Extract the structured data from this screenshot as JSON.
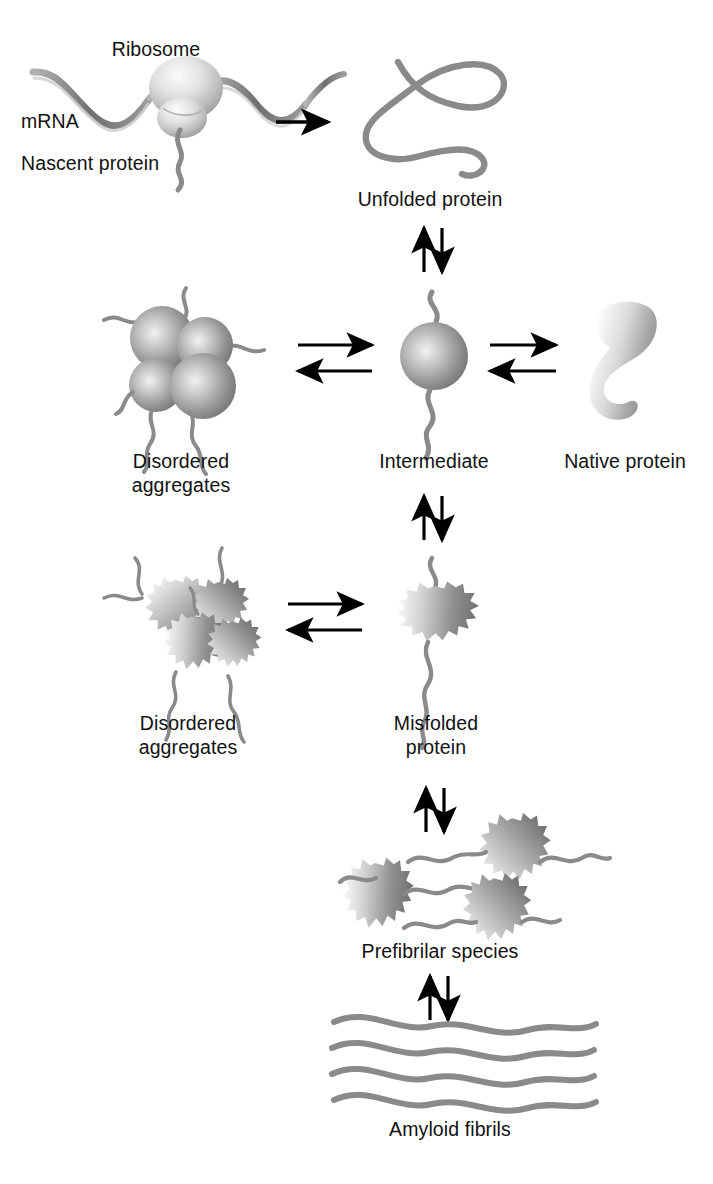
{
  "figure": {
    "background_color": "#ffffff",
    "text_color": "#111111",
    "chain_color": "#808080",
    "arrow_color": "#000000"
  },
  "labels": {
    "ribosome": "Ribosome",
    "mrna": "mRNA",
    "nascent_protein": "Nascent protein",
    "unfolded_protein": "Unfolded protein",
    "disordered_aggregates_top_line1": "Disordered",
    "disordered_aggregates_top_line2": "aggregates",
    "intermediate": "Intermediate",
    "native_protein": "Native protein",
    "disordered_aggregates_bottom_line1": "Disordered",
    "disordered_aggregates_bottom_line2": "aggregates",
    "misfolded_protein_line1": "Misfolded",
    "misfolded_protein_line2": "protein",
    "prefibrilar_species": "Prefibrilar species",
    "amyloid_fibrils": "Amyloid fibrils"
  },
  "nodes": [
    {
      "id": "ribosome-complex",
      "label": "Ribosome",
      "x": 175,
      "y": 110
    },
    {
      "id": "unfolded-protein",
      "label": "Unfolded protein",
      "x": 430,
      "y": 120
    },
    {
      "id": "disordered-aggregates-top",
      "label": "Disordered aggregates",
      "x": 185,
      "y": 355
    },
    {
      "id": "intermediate",
      "label": "Intermediate",
      "x": 440,
      "y": 355
    },
    {
      "id": "native-protein",
      "label": "Native protein",
      "x": 620,
      "y": 355
    },
    {
      "id": "disordered-aggregates-bottom",
      "label": "Disordered aggregates",
      "x": 195,
      "y": 620
    },
    {
      "id": "misfolded-protein",
      "label": "Misfolded protein",
      "x": 435,
      "y": 620
    },
    {
      "id": "prefibrilar-species",
      "label": "Prefibrilar species",
      "x": 440,
      "y": 880
    },
    {
      "id": "amyloid-fibrils",
      "label": "Amyloid fibrils",
      "x": 450,
      "y": 1065
    }
  ],
  "arrows": [
    {
      "id": "ribosome-to-unfolded",
      "type": "single",
      "orientation": "horizontal",
      "direction": "right"
    },
    {
      "id": "unfolded-to-intermediate",
      "type": "equilibrium",
      "orientation": "vertical"
    },
    {
      "id": "aggregates-to-intermediate",
      "type": "equilibrium",
      "orientation": "horizontal"
    },
    {
      "id": "intermediate-to-native",
      "type": "equilibrium",
      "orientation": "horizontal"
    },
    {
      "id": "intermediate-to-misfolded",
      "type": "equilibrium",
      "orientation": "vertical"
    },
    {
      "id": "aggregates2-to-misfolded",
      "type": "equilibrium",
      "orientation": "horizontal"
    },
    {
      "id": "misfolded-to-prefibrilar",
      "type": "equilibrium",
      "orientation": "vertical"
    },
    {
      "id": "prefibrilar-to-amyloid",
      "type": "equilibrium",
      "orientation": "vertical"
    }
  ]
}
